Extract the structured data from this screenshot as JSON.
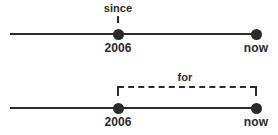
{
  "diagram": {
    "background_color": "#ffffff",
    "ink_color": "#2b2b2b",
    "timelines": [
      {
        "id": "since",
        "keyword_label": "since",
        "start_point_label": "2006",
        "end_point_label": "now",
        "marker_style": "point",
        "connector": "solid-tick"
      },
      {
        "id": "for",
        "keyword_label": "for",
        "start_point_label": "2006",
        "end_point_label": "now",
        "marker_style": "span",
        "connector": "dashed-bracket"
      }
    ]
  }
}
